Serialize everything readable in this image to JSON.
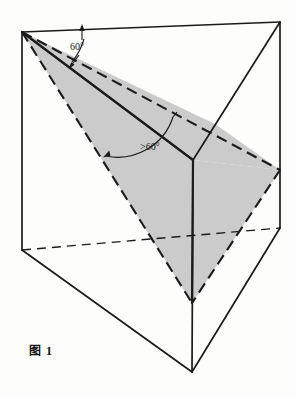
{
  "figure": {
    "caption": "图 1",
    "annotations": {
      "angle_top": "60°",
      "angle_middle": ">60°"
    },
    "colors": {
      "stroke": "#1b1b1b",
      "shade_fill": "#cccccc",
      "background": "#fdfdfc"
    }
  },
  "geometry": {
    "description": "Triangular prism with shaded inclined cross-section plane",
    "vertices": {
      "top_back_left": [
        22,
        32
      ],
      "top_back_right": [
        280,
        22
      ],
      "top_front": [
        193,
        160
      ],
      "bottom_back_left": [
        22,
        250
      ],
      "bottom_back_right": [
        280,
        228
      ],
      "bottom_front": [
        192,
        372
      ]
    },
    "section_plane": {
      "apex": [
        22,
        32
      ],
      "right": [
        280,
        170
      ],
      "bottom": [
        192,
        303
      ]
    }
  }
}
